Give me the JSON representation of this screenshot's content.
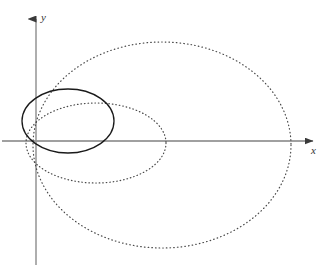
{
  "figure": {
    "kind": "geometry-diagram",
    "background_color": "#ffffff"
  },
  "axes": {
    "x_axis": {
      "label": "x",
      "color": "#808080",
      "start": {
        "x": 2,
        "y": 141
      },
      "end": {
        "x": 320,
        "y": 141
      },
      "arrow": "right",
      "label_position": {
        "x": 311,
        "y": 145
      }
    },
    "y_axis": {
      "label": "y",
      "color": "#9a9a9a",
      "start": {
        "x": 36,
        "y": 265
      },
      "end": {
        "x": 36,
        "y": 11
      },
      "arrow": "up",
      "label_position": {
        "x": 41,
        "y": 12
      }
    },
    "origin": {
      "x": 36,
      "y": 141
    }
  },
  "chart_data": {
    "type": "scatter",
    "title": "",
    "xlabel": "x",
    "ylabel": "y",
    "grid": false,
    "legend": null,
    "curves": [
      {
        "name": "small-solid-ellipse",
        "shape": "ellipse",
        "style": "solid",
        "color": "#1a1a1a",
        "stroke_width": 1.3,
        "center": {
          "x": 68,
          "y": 121
        },
        "radius_x": 46,
        "radius_y": 32,
        "rotation_deg": 0
      },
      {
        "name": "medium-dotted-ellipse",
        "shape": "ellipse",
        "style": "dotted",
        "color": "#4a4a4a",
        "stroke_width": 1.2,
        "center": {
          "x": 96,
          "y": 143
        },
        "radius_x": 70,
        "radius_y": 40,
        "rotation_deg": 0
      },
      {
        "name": "large-dotted-ellipse",
        "shape": "ellipse",
        "style": "dotted",
        "color": "#4a4a4a",
        "stroke_width": 1.2,
        "center": {
          "x": 162,
          "y": 145
        },
        "radius_x": 129,
        "radius_y": 103,
        "rotation_deg": 0
      }
    ]
  }
}
